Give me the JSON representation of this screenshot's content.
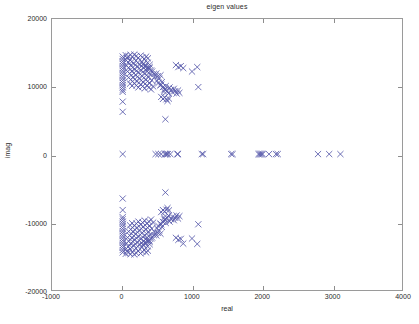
{
  "chart_data": {
    "type": "scatter",
    "title": "eigen values",
    "xlabel": "real",
    "ylabel": "imag",
    "xlim": [
      -1000,
      4000
    ],
    "ylim": [
      -20000,
      20000
    ],
    "xticks": [
      -1000,
      0,
      1000,
      2000,
      3000,
      4000
    ],
    "xticklabels": [
      "-1000",
      "0",
      "1000",
      "2000",
      "3000",
      "4000"
    ],
    "yticks": [
      -20000,
      -10000,
      0,
      10000,
      20000
    ],
    "yticklabels": [
      "-20000",
      "-10000",
      "0",
      "10000",
      "20000"
    ],
    "grid": false,
    "legend": null,
    "marker": "x",
    "marker_color": "#5558aa",
    "marker_size": 4,
    "series": [
      {
        "name": "eigenvalues",
        "points": [
          [
            10,
            14450
          ],
          [
            10,
            14100
          ],
          [
            10,
            13750
          ],
          [
            10,
            13400
          ],
          [
            10,
            13050
          ],
          [
            10,
            12700
          ],
          [
            10,
            12350
          ],
          [
            10,
            12000
          ],
          [
            10,
            11650
          ],
          [
            10,
            11300
          ],
          [
            10,
            10950
          ],
          [
            10,
            10600
          ],
          [
            10,
            10250
          ],
          [
            10,
            9900
          ],
          [
            10,
            9550
          ],
          [
            10,
            9250
          ],
          [
            10,
            7800
          ],
          [
            10,
            6300
          ],
          [
            55,
            14650
          ],
          [
            70,
            14250
          ],
          [
            95,
            14500
          ],
          [
            120,
            14700
          ],
          [
            150,
            14400
          ],
          [
            175,
            14750
          ],
          [
            205,
            14550
          ],
          [
            230,
            14250
          ],
          [
            265,
            14600
          ],
          [
            290,
            14350
          ],
          [
            320,
            14100
          ],
          [
            345,
            14450
          ],
          [
            370,
            14200
          ],
          [
            60,
            13900
          ],
          [
            90,
            13600
          ],
          [
            115,
            13950
          ],
          [
            140,
            13700
          ],
          [
            170,
            13400
          ],
          [
            200,
            13850
          ],
          [
            225,
            13550
          ],
          [
            255,
            13250
          ],
          [
            285,
            13700
          ],
          [
            310,
            13400
          ],
          [
            340,
            13100
          ],
          [
            365,
            13550
          ],
          [
            395,
            13250
          ],
          [
            65,
            13100
          ],
          [
            95,
            12800
          ],
          [
            125,
            13150
          ],
          [
            155,
            12850
          ],
          [
            185,
            12550
          ],
          [
            215,
            13000
          ],
          [
            245,
            12700
          ],
          [
            275,
            12400
          ],
          [
            305,
            12850
          ],
          [
            335,
            12550
          ],
          [
            360,
            12250
          ],
          [
            390,
            12700
          ],
          [
            415,
            12400
          ],
          [
            80,
            12250
          ],
          [
            110,
            11950
          ],
          [
            140,
            12300
          ],
          [
            170,
            12000
          ],
          [
            200,
            11700
          ],
          [
            230,
            12150
          ],
          [
            260,
            11850
          ],
          [
            290,
            11550
          ],
          [
            320,
            12000
          ],
          [
            350,
            11700
          ],
          [
            380,
            11400
          ],
          [
            405,
            11850
          ],
          [
            95,
            11350
          ],
          [
            125,
            11050
          ],
          [
            155,
            11400
          ],
          [
            185,
            11100
          ],
          [
            215,
            10800
          ],
          [
            245,
            11250
          ],
          [
            275,
            10950
          ],
          [
            305,
            10650
          ],
          [
            335,
            11100
          ],
          [
            365,
            10800
          ],
          [
            395,
            10500
          ],
          [
            425,
            10950
          ],
          [
            115,
            10450
          ],
          [
            145,
            10150
          ],
          [
            175,
            10500
          ],
          [
            205,
            10200
          ],
          [
            235,
            9900
          ],
          [
            265,
            10350
          ],
          [
            295,
            10050
          ],
          [
            325,
            9750
          ],
          [
            355,
            10200
          ],
          [
            385,
            9900
          ],
          [
            415,
            9600
          ],
          [
            445,
            10050
          ],
          [
            300,
            13300
          ],
          [
            330,
            13000
          ],
          [
            360,
            12650
          ],
          [
            395,
            12900
          ],
          [
            430,
            12250
          ],
          [
            455,
            11900
          ],
          [
            470,
            11500
          ],
          [
            490,
            11950
          ],
          [
            510,
            11550
          ],
          [
            530,
            11200
          ],
          [
            550,
            11700
          ],
          [
            500,
            10900
          ],
          [
            520,
            10550
          ],
          [
            545,
            10200
          ],
          [
            570,
            10700
          ],
          [
            560,
            10300
          ],
          [
            585,
            9950
          ],
          [
            605,
            9600
          ],
          [
            625,
            10100
          ],
          [
            600,
            9300
          ],
          [
            620,
            9650
          ],
          [
            645,
            9350
          ],
          [
            665,
            9000
          ],
          [
            680,
            9900
          ],
          [
            700,
            9550
          ],
          [
            720,
            9200
          ],
          [
            740,
            9700
          ],
          [
            760,
            9350
          ],
          [
            780,
            9000
          ],
          [
            800,
            9450
          ],
          [
            820,
            9100
          ],
          [
            560,
            8500
          ],
          [
            585,
            8200
          ],
          [
            610,
            8450
          ],
          [
            635,
            8150
          ],
          [
            650,
            7900
          ],
          [
            670,
            8250
          ],
          [
            620,
            5200
          ],
          [
            770,
            13200
          ],
          [
            805,
            12900
          ],
          [
            840,
            13050
          ],
          [
            875,
            12750
          ],
          [
            1000,
            12250
          ],
          [
            1075,
            12900
          ],
          [
            1090,
            9950
          ],
          [
            10,
            60
          ],
          [
            480,
            60
          ],
          [
            520,
            60
          ],
          [
            560,
            60
          ],
          [
            610,
            60
          ],
          [
            625,
            60
          ],
          [
            640,
            60
          ],
          [
            655,
            60
          ],
          [
            690,
            60
          ],
          [
            790,
            60
          ],
          [
            800,
            60
          ],
          [
            1140,
            60
          ],
          [
            1160,
            60
          ],
          [
            1560,
            60
          ],
          [
            1580,
            60
          ],
          [
            1950,
            60
          ],
          [
            1965,
            60
          ],
          [
            1980,
            60
          ],
          [
            1995,
            60
          ],
          [
            2010,
            60
          ],
          [
            2100,
            60
          ],
          [
            2200,
            60
          ],
          [
            2225,
            60
          ],
          [
            2800,
            60
          ],
          [
            2960,
            60
          ],
          [
            3120,
            60
          ],
          [
            10,
            -14450
          ],
          [
            10,
            -14100
          ],
          [
            10,
            -13750
          ],
          [
            10,
            -13400
          ],
          [
            10,
            -13050
          ],
          [
            10,
            -12700
          ],
          [
            10,
            -12350
          ],
          [
            10,
            -12000
          ],
          [
            10,
            -11650
          ],
          [
            10,
            -11300
          ],
          [
            10,
            -10950
          ],
          [
            10,
            -10600
          ],
          [
            10,
            -10250
          ],
          [
            10,
            -9900
          ],
          [
            10,
            -9550
          ],
          [
            10,
            -9250
          ],
          [
            10,
            -8200
          ],
          [
            10,
            -6500
          ],
          [
            55,
            -14650
          ],
          [
            70,
            -14250
          ],
          [
            95,
            -14500
          ],
          [
            120,
            -14700
          ],
          [
            150,
            -14400
          ],
          [
            175,
            -14750
          ],
          [
            205,
            -14550
          ],
          [
            230,
            -14250
          ],
          [
            265,
            -14600
          ],
          [
            290,
            -14350
          ],
          [
            320,
            -14100
          ],
          [
            345,
            -14450
          ],
          [
            370,
            -14200
          ],
          [
            60,
            -13900
          ],
          [
            90,
            -13600
          ],
          [
            115,
            -13950
          ],
          [
            140,
            -13700
          ],
          [
            170,
            -13400
          ],
          [
            200,
            -13850
          ],
          [
            225,
            -13550
          ],
          [
            255,
            -13250
          ],
          [
            285,
            -13700
          ],
          [
            310,
            -13400
          ],
          [
            340,
            -13100
          ],
          [
            365,
            -13550
          ],
          [
            395,
            -13250
          ],
          [
            65,
            -13100
          ],
          [
            95,
            -12800
          ],
          [
            125,
            -13150
          ],
          [
            155,
            -12850
          ],
          [
            185,
            -12550
          ],
          [
            215,
            -13000
          ],
          [
            245,
            -12700
          ],
          [
            275,
            -12400
          ],
          [
            305,
            -12850
          ],
          [
            335,
            -12550
          ],
          [
            360,
            -12250
          ],
          [
            390,
            -12700
          ],
          [
            415,
            -12400
          ],
          [
            80,
            -12250
          ],
          [
            110,
            -11950
          ],
          [
            140,
            -12300
          ],
          [
            170,
            -12000
          ],
          [
            200,
            -11700
          ],
          [
            230,
            -12150
          ],
          [
            260,
            -11850
          ],
          [
            290,
            -11550
          ],
          [
            320,
            -12000
          ],
          [
            350,
            -11700
          ],
          [
            380,
            -11400
          ],
          [
            405,
            -11850
          ],
          [
            95,
            -11350
          ],
          [
            125,
            -11050
          ],
          [
            155,
            -11400
          ],
          [
            185,
            -11100
          ],
          [
            215,
            -10800
          ],
          [
            245,
            -11250
          ],
          [
            275,
            -10950
          ],
          [
            305,
            -10650
          ],
          [
            335,
            -11100
          ],
          [
            365,
            -10800
          ],
          [
            395,
            -10500
          ],
          [
            425,
            -10950
          ],
          [
            115,
            -10450
          ],
          [
            145,
            -10150
          ],
          [
            175,
            -10500
          ],
          [
            205,
            -10200
          ],
          [
            235,
            -9900
          ],
          [
            265,
            -10350
          ],
          [
            295,
            -10050
          ],
          [
            325,
            -9750
          ],
          [
            355,
            -10200
          ],
          [
            385,
            -9900
          ],
          [
            415,
            -9600
          ],
          [
            445,
            -10050
          ],
          [
            300,
            -13300
          ],
          [
            330,
            -13000
          ],
          [
            360,
            -12650
          ],
          [
            395,
            -12900
          ],
          [
            430,
            -12250
          ],
          [
            455,
            -11900
          ],
          [
            470,
            -11500
          ],
          [
            490,
            -11950
          ],
          [
            510,
            -11550
          ],
          [
            530,
            -11200
          ],
          [
            550,
            -11700
          ],
          [
            500,
            -10900
          ],
          [
            520,
            -10550
          ],
          [
            545,
            -10200
          ],
          [
            570,
            -10700
          ],
          [
            560,
            -10300
          ],
          [
            585,
            -9950
          ],
          [
            605,
            -9600
          ],
          [
            625,
            -10100
          ],
          [
            600,
            -9300
          ],
          [
            620,
            -9650
          ],
          [
            645,
            -9350
          ],
          [
            665,
            -9000
          ],
          [
            680,
            -9900
          ],
          [
            700,
            -9550
          ],
          [
            720,
            -9200
          ],
          [
            740,
            -9700
          ],
          [
            760,
            -9350
          ],
          [
            780,
            -9000
          ],
          [
            800,
            -9450
          ],
          [
            820,
            -9100
          ],
          [
            560,
            -8500
          ],
          [
            585,
            -8200
          ],
          [
            610,
            -8450
          ],
          [
            635,
            -8150
          ],
          [
            650,
            -7900
          ],
          [
            670,
            -8250
          ],
          [
            620,
            -5600
          ],
          [
            770,
            -12300
          ],
          [
            805,
            -12600
          ],
          [
            840,
            -12450
          ],
          [
            875,
            -13150
          ],
          [
            1000,
            -12400
          ],
          [
            1075,
            -13200
          ],
          [
            1090,
            -10300
          ]
        ]
      }
    ]
  }
}
